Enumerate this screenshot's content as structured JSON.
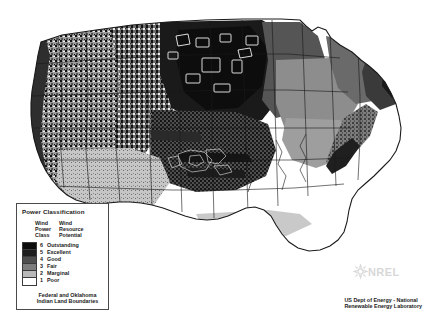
{
  "figure": {
    "width": 434,
    "height": 323,
    "background": "#ffffff"
  },
  "legend": {
    "title": "Power Classification",
    "headers": {
      "column_a": [
        "Wind",
        "Power",
        "Class"
      ],
      "column_b": [
        "Wind",
        "Resource",
        "Potential"
      ]
    },
    "classes": [
      {
        "class": "6",
        "label": "Outstanding",
        "color": "#0d0d0d"
      },
      {
        "class": "5",
        "label": "Excellent",
        "color": "#1f1f1f"
      },
      {
        "class": "4",
        "label": "Good",
        "color": "#4f4f4f"
      },
      {
        "class": "3",
        "label": "Fair",
        "color": "#7d7d7d"
      },
      {
        "class": "2",
        "label": "Marginal",
        "color": "#b8b8b8"
      },
      {
        "class": "1",
        "label": "Poor",
        "color": "#ffffff"
      }
    ],
    "footer": [
      "Federal and Oklahoma",
      "Indian Land Boundaries"
    ],
    "border_color": "#4a4a4a"
  },
  "credit": {
    "lines": [
      "US Dept of Energy - National",
      "Renewable Energy Laboratory"
    ]
  },
  "logo": {
    "wordmark": "NREL",
    "mark_name": "nrel-diamond-mark",
    "color": "#8d8d8d"
  },
  "map": {
    "name": "us-wind-resource-choropleth",
    "projection": "conus-albers",
    "description": "Grayscale wind power class raster over the contiguous United States with state boundaries and Indian land boundaries.",
    "palette": {
      "class6": "#0d0d0d",
      "class5": "#1f1f1f",
      "class4": "#4f4f4f",
      "class3": "#7d7d7d",
      "class2": "#b8b8b8",
      "class1": "#ffffff",
      "boundary": "#1a1a1a",
      "reservation_outline": "#ffffff"
    },
    "regions": [
      {
        "name": "pacific-northwest",
        "dominant_class": "5"
      },
      {
        "name": "northern-rockies",
        "dominant_class": "5"
      },
      {
        "name": "northern-great-plains",
        "dominant_class": "6"
      },
      {
        "name": "central-great-plains",
        "dominant_class": "4"
      },
      {
        "name": "southwest",
        "dominant_class": "2"
      },
      {
        "name": "midwest",
        "dominant_class": "3"
      },
      {
        "name": "southeast",
        "dominant_class": "1"
      },
      {
        "name": "appalachian-ridges",
        "dominant_class": "5"
      },
      {
        "name": "northeast-coast",
        "dominant_class": "4"
      },
      {
        "name": "florida",
        "dominant_class": "1"
      },
      {
        "name": "gulf-coast",
        "dominant_class": "2"
      }
    ]
  }
}
